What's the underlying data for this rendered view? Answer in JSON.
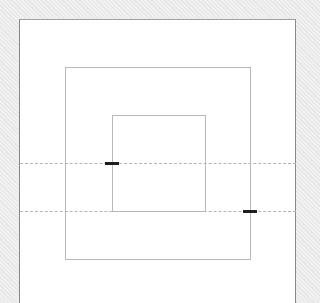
{
  "diagram": {
    "type": "nested-rectangles",
    "background_color": "#ececec",
    "canvas": {
      "x": 19,
      "y": 19,
      "width": 277,
      "height": 284,
      "fill": "#ffffff",
      "border_color": "#8a8a8a"
    },
    "boxes": [
      {
        "name": "middle-box",
        "x": 65,
        "y": 67,
        "width": 186,
        "height": 193,
        "stroke": "#b8b8b8"
      },
      {
        "name": "inner-box",
        "x": 112,
        "y": 115,
        "width": 94,
        "height": 97,
        "stroke": "#b8b8b8"
      }
    ],
    "guides": [
      {
        "name": "guide-line-upper",
        "y": 163,
        "x1": 20,
        "x2": 296,
        "style": "dashed",
        "color": "#b5b5b5"
      },
      {
        "name": "guide-line-lower",
        "y": 211,
        "x1": 20,
        "x2": 296,
        "style": "dashed",
        "color": "#b5b5b5"
      }
    ],
    "markers": [
      {
        "name": "marker-inner-left",
        "x": 105,
        "y": 162,
        "width": 14,
        "height": 3,
        "color": "#1e1e1e"
      },
      {
        "name": "marker-middle-right",
        "x": 243,
        "y": 210,
        "width": 14,
        "height": 3,
        "color": "#1e1e1e"
      }
    ]
  }
}
